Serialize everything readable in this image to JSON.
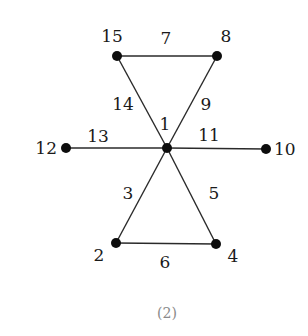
{
  "diagram": {
    "caption": "(2)",
    "nodes": [
      {
        "id": "1",
        "label": "1",
        "x": 167,
        "y": 148,
        "lx": 165,
        "ly": 130,
        "anchor": "middle"
      },
      {
        "id": "2",
        "label": "2",
        "x": 116,
        "y": 243,
        "lx": 99,
        "ly": 261,
        "anchor": "middle"
      },
      {
        "id": "4",
        "label": "4",
        "x": 216,
        "y": 244,
        "lx": 233,
        "ly": 262,
        "anchor": "middle"
      },
      {
        "id": "8",
        "label": "8",
        "x": 217,
        "y": 56,
        "lx": 226,
        "ly": 42,
        "anchor": "middle"
      },
      {
        "id": "10",
        "label": "10",
        "x": 266,
        "y": 149,
        "lx": 274,
        "ly": 155,
        "anchor": "start"
      },
      {
        "id": "12",
        "label": "12",
        "x": 66,
        "y": 148,
        "lx": 57,
        "ly": 154,
        "anchor": "end"
      },
      {
        "id": "15",
        "label": "15",
        "x": 117,
        "y": 56,
        "lx": 112,
        "ly": 42,
        "anchor": "middle"
      }
    ],
    "edges": [
      {
        "label": "7",
        "from": "15",
        "to": "8",
        "lx": 166,
        "ly": 44
      },
      {
        "label": "14",
        "from": "15",
        "to": "1",
        "lx": 123,
        "ly": 110
      },
      {
        "label": "9",
        "from": "8",
        "to": "1",
        "lx": 206,
        "ly": 110
      },
      {
        "label": "13",
        "from": "12",
        "to": "1",
        "lx": 98,
        "ly": 142
      },
      {
        "label": "11",
        "from": "1",
        "to": "10",
        "lx": 209,
        "ly": 141
      },
      {
        "label": "3",
        "from": "1",
        "to": "2",
        "lx": 128,
        "ly": 199
      },
      {
        "label": "5",
        "from": "1",
        "to": "4",
        "lx": 214,
        "ly": 199
      },
      {
        "label": "6",
        "from": "2",
        "to": "4",
        "lx": 165,
        "ly": 268
      }
    ]
  }
}
